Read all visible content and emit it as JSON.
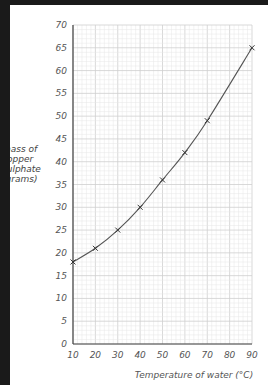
{
  "chart_data": {
    "type": "line",
    "title": "",
    "xlabel": "Temperature of water (°C)",
    "ylabel": "mass of copper sulphate (grams)",
    "ylabel_lines": [
      "mass of",
      "copper",
      "sulphate",
      "(grams)"
    ],
    "x_ticks": [
      10,
      20,
      30,
      40,
      50,
      60,
      70,
      80,
      90
    ],
    "y_ticks": [
      0,
      5,
      10,
      15,
      20,
      25,
      30,
      35,
      40,
      45,
      50,
      55,
      60,
      65,
      70
    ],
    "xlim": [
      10,
      90
    ],
    "ylim": [
      0,
      70
    ],
    "grid": true,
    "marker": "x",
    "series": [
      {
        "name": "solubility",
        "x": [
          10,
          20,
          30,
          40,
          50,
          60,
          70,
          90
        ],
        "values": [
          18,
          21,
          25,
          30,
          36,
          42,
          49,
          65
        ]
      }
    ]
  },
  "colors": {
    "grid_minor": "#e6e6e6",
    "grid_major": "#cfcfcf",
    "axis": "#444444",
    "line": "#555555"
  }
}
